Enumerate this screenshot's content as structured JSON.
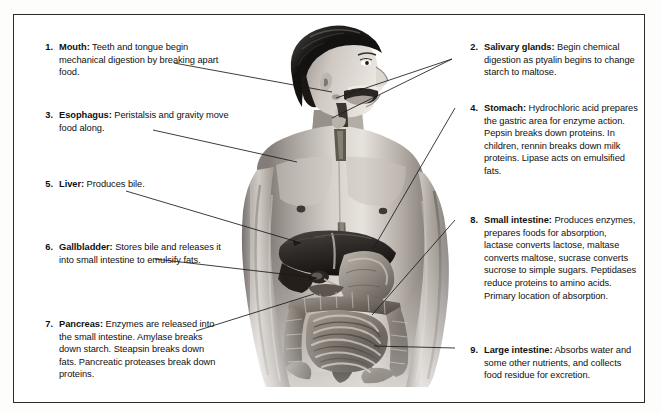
{
  "figure": {
    "border_color": "#2b2b2b",
    "background": "#ffffff"
  },
  "illustration": {
    "name": "human-digestive-system",
    "description": "Grayscale anatomical illustration of a man's head in profile and bare torso, showing the mouth, salivary glands, esophagus, stomach, liver, gallbladder, pancreas, small intestine and large intestine",
    "organs": [
      "mouth",
      "salivary glands",
      "esophagus",
      "stomach",
      "liver",
      "gallbladder",
      "pancreas",
      "small intestine",
      "large intestine"
    ]
  },
  "callouts": {
    "left": [
      {
        "number": "1.",
        "term": "Mouth:",
        "text": " Teeth and tongue begin mechanical digestion by breaking apart food.",
        "x": 24,
        "y": 26,
        "width": 196
      },
      {
        "number": "3.",
        "term": "Esophagus:",
        "text": " Peristalsis and gravity move food along.",
        "x": 24,
        "y": 94,
        "width": 196
      },
      {
        "number": "5.",
        "term": "Liver:",
        "text": " Produces bile.",
        "x": 24,
        "y": 163,
        "width": 196
      },
      {
        "number": "6.",
        "term": "Gallbladder:",
        "text": " Stores bile and releases it into small intestine to emulsify fats.",
        "x": 24,
        "y": 226,
        "width": 196
      },
      {
        "number": "7.",
        "term": "Pancreas:",
        "text": " Enzymes are released into the small intestine. Amylase breaks down starch. Steapsin breaks down fats. Pancreatic proteases break down proteins.",
        "x": 24,
        "y": 303,
        "width": 184
      }
    ],
    "right": [
      {
        "number": "2.",
        "term": "Salivary glands:",
        "text": " Begin chemical digestion as ptyalin begins to change starch to maltose.",
        "x": 449,
        "y": 26,
        "width": 175
      },
      {
        "number": "4.",
        "term": "Stomach:",
        "text": " Hydrochloric acid prepares the gastric area for enzyme action. Pepsin breaks down proteins. In children, rennin breaks down milk proteins. Lipase acts on emulsified fats.",
        "x": 449,
        "y": 87,
        "width": 175
      },
      {
        "number": "8.",
        "term": "Small intestine:",
        "text": " Produces enzymes, prepares foods for absorption, lactase converts lactose, maltase converts maltose, sucrase converts sucrose to simple sugars. Peptidases reduce proteins to amino acids. Primary location of absorption.",
        "x": 449,
        "y": 199,
        "width": 175
      },
      {
        "number": "9.",
        "term": "Large intestine:",
        "text": " Absorbs water and some other nutrients, and collects food residue for excretion.",
        "x": 449,
        "y": 329,
        "width": 175
      }
    ]
  },
  "leader_lines": [
    {
      "name": "leader-mouth",
      "from": [
        160,
        48
      ],
      "to": [
        318,
        77
      ]
    },
    {
      "name": "leader-esophagus",
      "from": [
        139,
        115
      ],
      "to": [
        283,
        147
      ]
    },
    {
      "name": "leader-liver",
      "from": [
        112,
        176
      ],
      "to": [
        287,
        228
      ]
    },
    {
      "name": "leader-gallbladder",
      "from": [
        141,
        244
      ],
      "to": [
        303,
        263
      ]
    },
    {
      "name": "leader-pancreas",
      "from": [
        182,
        316
      ],
      "to": [
        300,
        279
      ]
    },
    {
      "name": "leader-salivary-a",
      "from": [
        438,
        44
      ],
      "to": [
        322,
        83
      ]
    },
    {
      "name": "leader-salivary-b",
      "from": [
        438,
        44
      ],
      "to": [
        318,
        103
      ]
    },
    {
      "name": "leader-stomach",
      "from": [
        441,
        93
      ],
      "to": [
        359,
        234
      ]
    },
    {
      "name": "leader-small-intestine",
      "from": [
        441,
        205
      ],
      "to": [
        358,
        300
      ]
    },
    {
      "name": "leader-large-intestine",
      "from": [
        441,
        333
      ],
      "to": [
        360,
        331
      ]
    }
  ]
}
